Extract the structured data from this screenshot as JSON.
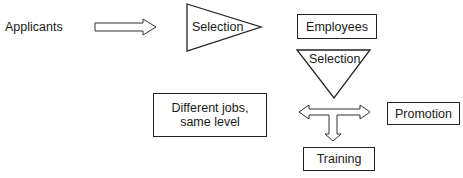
{
  "diagram": {
    "source_label": "Applicants",
    "entry_selection_label": "Selection",
    "employees_label": "Employees",
    "internal_selection_label": "Selection",
    "lateral_box_label": "Different jobs, same level",
    "promotion_label": "Promotion",
    "training_label": "Training",
    "stroke_color": "#222222",
    "fill_color": "#ffffff"
  }
}
